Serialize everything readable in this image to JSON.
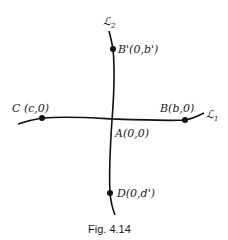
{
  "figure": {
    "caption": "Fig. 4.14",
    "lines": [
      {
        "name": "L1",
        "label_script": "ℒ",
        "label_sub": "1"
      },
      {
        "name": "L2",
        "label_script": "ℒ",
        "label_sub": "2"
      }
    ],
    "points": [
      {
        "name": "A",
        "label": "A(0,0)"
      },
      {
        "name": "B",
        "label": "B(b,0)"
      },
      {
        "name": "B'",
        "label": "B'(0,b')"
      },
      {
        "name": "C",
        "label": "C (c,0)"
      },
      {
        "name": "D",
        "label": "D(0,d')"
      }
    ],
    "colors": {
      "ink": "#111111",
      "background": "#ffffff"
    }
  }
}
